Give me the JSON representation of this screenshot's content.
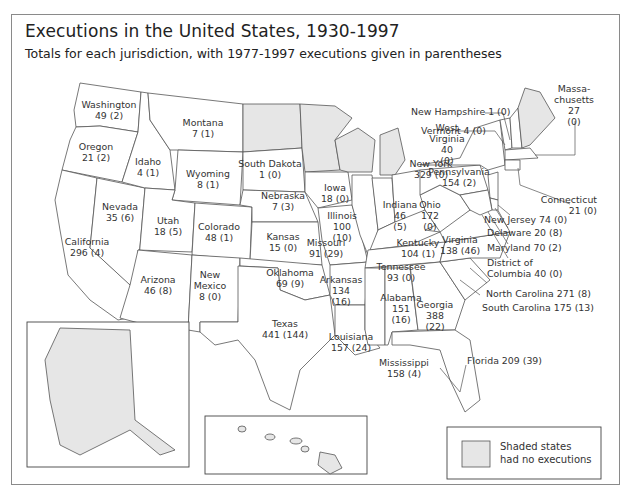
{
  "title": "Executions in the United States, 1930-1997",
  "subtitle": "Totals for each jurisdiction, with 1977-1997 executions given in parentheses",
  "legend": {
    "swatch_color": "#e6e6e6",
    "line1": "Shaded states",
    "line2": "had no executions"
  },
  "colors": {
    "shaded": "#e6e6e6",
    "unshaded": "#ffffff",
    "border": "#555555"
  },
  "shaded_states": [
    "North Dakota",
    "Minnesota",
    "Wisconsin",
    "Michigan",
    "Maine",
    "Alaska",
    "Hawaii"
  ],
  "states": [
    {
      "name": "Washington",
      "total": "49",
      "post1977": "2",
      "line1": "Washington",
      "line2": "49 (2)"
    },
    {
      "name": "Oregon",
      "total": "21",
      "post1977": "2",
      "line1": "Oregon",
      "line2": "21 (2)"
    },
    {
      "name": "Idaho",
      "total": "4",
      "post1977": "1",
      "line1": "Idaho",
      "line2": "4 (1)"
    },
    {
      "name": "Montana",
      "total": "7",
      "post1977": "1",
      "line1": "Montana",
      "line2": "7 (1)"
    },
    {
      "name": "Wyoming",
      "total": "8",
      "post1977": "1",
      "line1": "Wyoming",
      "line2": "8 (1)"
    },
    {
      "name": "South Dakota",
      "total": "1",
      "post1977": "0",
      "line1": "South Dakota",
      "line2": "1 (0)"
    },
    {
      "name": "Nebraska",
      "total": "7",
      "post1977": "3",
      "line1": "Nebraska",
      "line2": "7 (3)"
    },
    {
      "name": "Iowa",
      "total": "18",
      "post1977": "0",
      "line1": "Iowa",
      "line2": "18 (0)"
    },
    {
      "name": "Nevada",
      "total": "35",
      "post1977": "6",
      "line1": "Nevada",
      "line2": "35 (6)"
    },
    {
      "name": "Utah",
      "total": "18",
      "post1977": "5",
      "line1": "Utah",
      "line2": "18 (5)"
    },
    {
      "name": "Colorado",
      "total": "48",
      "post1977": "1",
      "line1": "Colorado",
      "line2": "48 (1)"
    },
    {
      "name": "Kansas",
      "total": "15",
      "post1977": "0",
      "line1": "Kansas",
      "line2": "15 (0)"
    },
    {
      "name": "California",
      "total": "296",
      "post1977": "4",
      "line1": "California",
      "line2": "296 (4)"
    },
    {
      "name": "Arizona",
      "total": "46",
      "post1977": "8",
      "line1": "Arizona",
      "line2": "46 (8)"
    },
    {
      "name": "New Mexico",
      "total": "8",
      "post1977": "0",
      "line1": "New",
      "line2": "Mexico",
      "line3": "8 (0)"
    },
    {
      "name": "Oklahoma",
      "total": "69",
      "post1977": "9",
      "line1": "Oklahoma",
      "line2": "69 (9)"
    },
    {
      "name": "Texas",
      "total": "441",
      "post1977": "144",
      "line1": "Texas",
      "line2": "441 (144)"
    },
    {
      "name": "Missouri",
      "total": "91",
      "post1977": "29",
      "line1": "Missouri",
      "line2": "91 (29)"
    },
    {
      "name": "Arkansas",
      "total": "134",
      "post1977": "16",
      "line1": "Arkansas",
      "line2": "134",
      "line3": "(16)"
    },
    {
      "name": "Louisiana",
      "total": "157",
      "post1977": "24",
      "line1": "Louisiana",
      "line2": "157 (24)"
    },
    {
      "name": "Illinois",
      "total": "100",
      "post1977": "10",
      "line1": "Illinois",
      "line2": "100",
      "line3": "(10)"
    },
    {
      "name": "Indiana",
      "total": "46",
      "post1977": "5",
      "line1": "Indiana",
      "line2": "46",
      "line3": "(5)"
    },
    {
      "name": "Ohio",
      "total": "172",
      "post1977": "0",
      "line1": "Ohio",
      "line2": "172",
      "line3": "(0)"
    },
    {
      "name": "Kentucky",
      "total": "104",
      "post1977": "1",
      "line1": "Kentucky",
      "line2": "104 (1)"
    },
    {
      "name": "Tennessee",
      "total": "93",
      "post1977": "0",
      "line1": "Tennessee",
      "line2": "93 (0)"
    },
    {
      "name": "Mississippi",
      "total": "158",
      "post1977": "4",
      "line1": "Mississippi",
      "line2": "158 (4)"
    },
    {
      "name": "Alabama",
      "total": "151",
      "post1977": "16",
      "line1": "Alabama",
      "line2": "151",
      "line3": "(16)"
    },
    {
      "name": "Georgia",
      "total": "388",
      "post1977": "22",
      "line1": "Georgia",
      "line2": "388",
      "line3": "(22)"
    },
    {
      "name": "Florida",
      "total": "209",
      "post1977": "39",
      "line1": "Florida 209 (39)"
    },
    {
      "name": "South Carolina",
      "total": "175",
      "post1977": "13",
      "line1": "South Carolina 175 (13)"
    },
    {
      "name": "North Carolina",
      "total": "271",
      "post1977": "8",
      "line1": "North Carolina 271 (8)"
    },
    {
      "name": "Virginia",
      "total": "138",
      "post1977": "46",
      "line1": "Virginia",
      "line2": "138 (46)"
    },
    {
      "name": "West Virginia",
      "total": "40",
      "post1977": "0",
      "line1": "West",
      "line2": "Virginia",
      "line3": "40",
      "line4": "(0)"
    },
    {
      "name": "Pennsylvania",
      "total": "154",
      "post1977": "2",
      "line1": "Pennsylvania",
      "line2": "154 (2)"
    },
    {
      "name": "New York",
      "total": "329",
      "post1977": "0",
      "line1": "New York",
      "line2": "329 (0)"
    },
    {
      "name": "Vermont",
      "total": "4",
      "post1977": "0",
      "line1": "Vermont 4 (0)"
    },
    {
      "name": "New Hampshire",
      "total": "1",
      "post1977": "0",
      "line1": "New Hampshire 1 (0)"
    },
    {
      "name": "Massachusetts",
      "total": "27",
      "post1977": "0",
      "line1": "Massa-",
      "line2": "chusetts",
      "line3": "27",
      "line4": "(0)"
    },
    {
      "name": "Connecticut",
      "total": "21",
      "post1977": "0",
      "line1": "Connecticut",
      "line2": "21 (0)"
    },
    {
      "name": "New Jersey",
      "total": "74",
      "post1977": "0",
      "line1": "New Jersey 74 (0)"
    },
    {
      "name": "Delaware",
      "total": "20",
      "post1977": "8",
      "line1": "Delaware 20 (8)"
    },
    {
      "name": "Maryland",
      "total": "70",
      "post1977": "2",
      "line1": "Maryland 70 (2)"
    },
    {
      "name": "District of Columbia",
      "total": "40",
      "post1977": "0",
      "line1": "District of",
      "line2": "Columbia 40 (0)"
    }
  ]
}
